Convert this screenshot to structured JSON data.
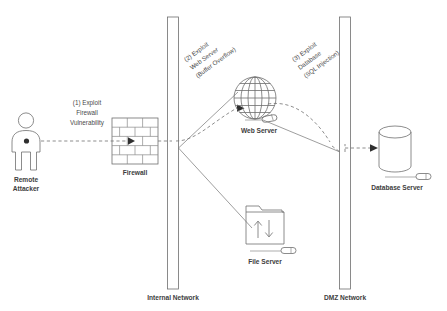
{
  "diagram": {
    "background_color": "#ffffff",
    "line_color": "#7a7a7a",
    "text_color": "#3d3d3d"
  },
  "zones": [
    {
      "id": "internal",
      "label": "Internal Network"
    },
    {
      "id": "dmz",
      "label": "DMZ Network"
    }
  ],
  "nodes": [
    {
      "id": "attacker",
      "label": "Remote Attacker",
      "label_line1": "Remote",
      "label_line2": "Attacker",
      "icon": "person-icon"
    },
    {
      "id": "firewall",
      "label": "Firewall",
      "icon": "brick-wall-icon"
    },
    {
      "id": "web_server",
      "label": "Web Server",
      "icon": "globe-icon"
    },
    {
      "id": "file_server",
      "label": "File Server",
      "icon": "folder-transfer-icon"
    },
    {
      "id": "database_server",
      "label": "Database Server",
      "icon": "database-cylinder-icon"
    }
  ],
  "steps": [
    {
      "number": "(1)",
      "label": "(1) Exploit Firewall Vulnerability",
      "line1": "(1) Exploit",
      "line2": "Firewall",
      "line3": "Vulnerability",
      "from": "attacker",
      "to": "firewall"
    },
    {
      "number": "(2)",
      "label": "(2) Exploit Web Server (Buffer Overflow)",
      "line1": "(2) Exploit",
      "line2": "Web Server",
      "line3": "(Buffer Overflow)",
      "from": "firewall",
      "to": "web_server"
    },
    {
      "number": "(3)",
      "label": "(3) Exploit Database (SQL Injection)",
      "line1": "(3) Exploit",
      "line2": "Database",
      "line3": "(SQL Injection)",
      "from": "web_server",
      "to": "database_server"
    }
  ]
}
